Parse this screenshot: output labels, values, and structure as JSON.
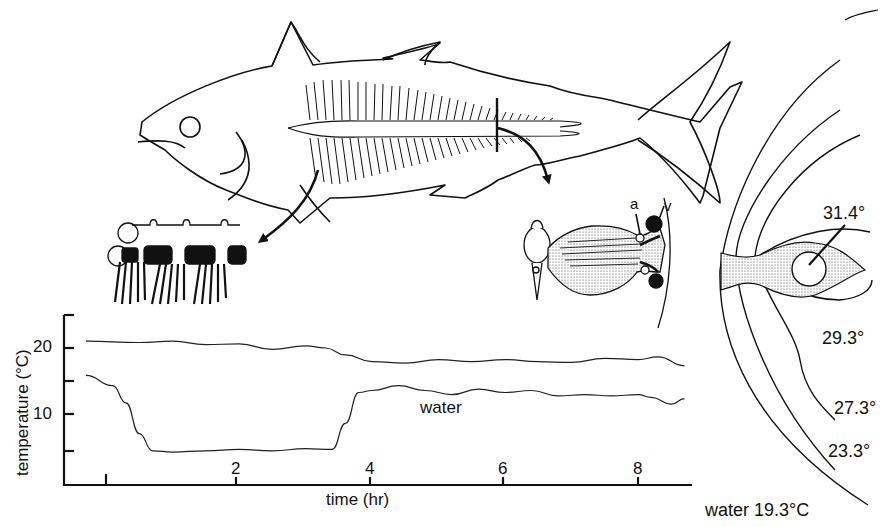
{
  "figure": {
    "subjects": {
      "fish": "tuna-outline-with-lateral-rete",
      "gill_detail": "gill-filaments-inset",
      "rete_detail": "cross-section-rete-mirabile",
      "rete_labels": {
        "artery": "a",
        "vein": "v"
      },
      "isotherm_section": "body-cross-section-isotherms"
    },
    "isotherms": {
      "labels": [
        "31.4°",
        "29.3°",
        "27.3°",
        "23.3°"
      ],
      "water_label": "water 19.3°C"
    },
    "chart": {
      "ylabel": "temperature (°C)",
      "xlabel": "time (hr)",
      "yticks": [
        "20",
        "10"
      ],
      "xticks": [
        "2",
        "4",
        "6",
        "8"
      ],
      "series_label": "water"
    }
  },
  "chart_data": {
    "type": "line",
    "title": "",
    "xlabel": "time (hr)",
    "ylabel": "temperature (°C)",
    "xlim": [
      -0.2,
      8.8
    ],
    "ylim": [
      0,
      25
    ],
    "xticks": [
      0,
      2,
      4,
      6,
      8
    ],
    "xtick_labels": [
      "",
      "2",
      "4",
      "6",
      "8"
    ],
    "yticks": [
      5,
      10,
      15,
      20
    ],
    "ytick_labels": [
      "",
      "10",
      "",
      "20"
    ],
    "grid": false,
    "legend": "inline label 'water' on lower trace",
    "series": [
      {
        "name": "body (muscle)",
        "x": [
          -0.3,
          0.5,
          1.0,
          1.5,
          2.0,
          2.5,
          3.0,
          3.3,
          3.6,
          4.0,
          4.5,
          5.0,
          5.5,
          6.0,
          6.5,
          7.0,
          7.5,
          8.0,
          8.3,
          8.7
        ],
        "values": [
          21.0,
          20.8,
          21.0,
          20.5,
          20.6,
          19.8,
          20.3,
          20.0,
          19.0,
          18.0,
          17.8,
          18.3,
          18.0,
          18.3,
          18.0,
          17.9,
          18.5,
          18.3,
          18.7,
          17.4
        ]
      },
      {
        "name": "water",
        "x": [
          -0.3,
          0.1,
          0.3,
          0.5,
          0.7,
          1.0,
          1.5,
          2.0,
          2.5,
          3.0,
          3.4,
          3.6,
          3.8,
          4.0,
          4.4,
          4.8,
          5.2,
          5.6,
          6.0,
          6.4,
          6.8,
          7.2,
          7.6,
          8.0,
          8.2,
          8.5,
          8.7
        ],
        "values": [
          16.0,
          14.5,
          12.0,
          7.5,
          5.0,
          4.8,
          5.0,
          5.2,
          5.0,
          5.3,
          5.2,
          9.0,
          13.5,
          13.8,
          14.5,
          13.8,
          13.2,
          14.0,
          13.5,
          13.8,
          13.0,
          13.2,
          13.0,
          13.2,
          12.8,
          11.8,
          12.6
        ]
      }
    ]
  }
}
